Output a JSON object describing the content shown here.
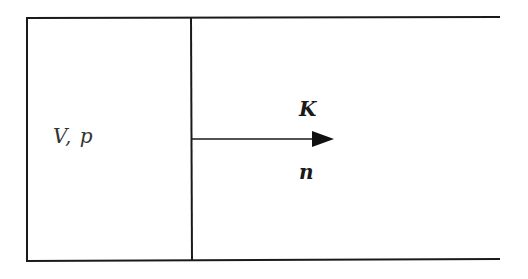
{
  "diagram": {
    "chamber_label": "V,  p",
    "vector_label": "K",
    "normal_label": "n",
    "colors": {
      "line": "#1a1a1a",
      "background": "#ffffff"
    },
    "geometry": {
      "outer_left_x": 27,
      "top_y": 18,
      "bottom_y": 261,
      "divider_x": 191,
      "right_end_x": 500,
      "arrow": {
        "x1": 191,
        "y": 139,
        "tip_x": 334,
        "head_base_x": 313,
        "head_half_height": 8
      }
    }
  }
}
